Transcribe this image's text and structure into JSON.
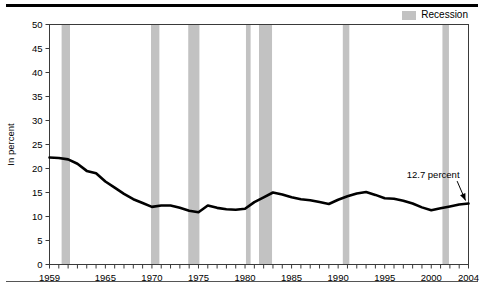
{
  "legend": {
    "items": [
      {
        "label": "Recession",
        "color": "#c2c2c2"
      }
    ]
  },
  "chart_data": {
    "type": "line",
    "title": "",
    "subtitle": "",
    "xlabel": "",
    "ylabel": "In percent",
    "xlim": [
      1959,
      2004
    ],
    "ylim": [
      0,
      50
    ],
    "grid": false,
    "legend_position": "top-right",
    "ytick_labels": [
      "0",
      "5",
      "10",
      "15",
      "20",
      "25",
      "30",
      "35",
      "40",
      "45",
      "50"
    ],
    "ytick_values": [
      0,
      5,
      10,
      15,
      20,
      25,
      30,
      35,
      40,
      45,
      50
    ],
    "xtick_labels": [
      "1959",
      "1965",
      "1970",
      "1975",
      "1980",
      "1985",
      "1990",
      "1995",
      "2000",
      "2004"
    ],
    "xtick_values": [
      1959,
      1965,
      1970,
      1975,
      1980,
      1985,
      1990,
      1995,
      2000,
      2004
    ],
    "x_minor_tick_interval": 1,
    "series": [
      {
        "name": "Percent",
        "color": "#000000",
        "x": [
          1959,
          1960,
          1961,
          1962,
          1963,
          1964,
          1965,
          1966,
          1967,
          1968,
          1969,
          1970,
          1971,
          1972,
          1973,
          1974,
          1975,
          1976,
          1977,
          1978,
          1979,
          1980,
          1981,
          1982,
          1983,
          1984,
          1985,
          1986,
          1987,
          1988,
          1989,
          1990,
          1991,
          1992,
          1993,
          1994,
          1995,
          1996,
          1997,
          1998,
          1999,
          2000,
          2001,
          2002,
          2003,
          2004
        ],
        "values": [
          22.3,
          22.2,
          21.9,
          21.0,
          19.5,
          19.0,
          17.3,
          16.0,
          14.7,
          13.6,
          12.8,
          12.0,
          12.3,
          12.3,
          11.8,
          11.2,
          10.9,
          12.3,
          11.8,
          11.5,
          11.4,
          11.6,
          13.0,
          14.0,
          15.0,
          14.6,
          14.0,
          13.6,
          13.4,
          13.0,
          12.6,
          13.5,
          14.2,
          14.8,
          15.1,
          14.5,
          13.8,
          13.7,
          13.3,
          12.7,
          11.9,
          11.3,
          11.7,
          12.1,
          12.5,
          12.7
        ]
      }
    ],
    "annotations": [
      {
        "text": "12.7 percent",
        "x_text": 2000.2,
        "y_text": 18.0,
        "x_point": 2004,
        "y_point": 12.7,
        "arrow": true
      }
    ],
    "shaded_bands": [
      {
        "label": "Recession",
        "start": 1960.3,
        "end": 1961.2
      },
      {
        "label": "Recession",
        "start": 1969.9,
        "end": 1970.8
      },
      {
        "label": "Recession",
        "start": 1973.9,
        "end": 1975.1
      },
      {
        "label": "Recession",
        "start": 1980.1,
        "end": 1980.6
      },
      {
        "label": "Recession",
        "start": 1981.5,
        "end": 1982.9
      },
      {
        "label": "Recession",
        "start": 1990.5,
        "end": 1991.2
      },
      {
        "label": "Recession",
        "start": 2001.2,
        "end": 2001.9
      }
    ]
  }
}
